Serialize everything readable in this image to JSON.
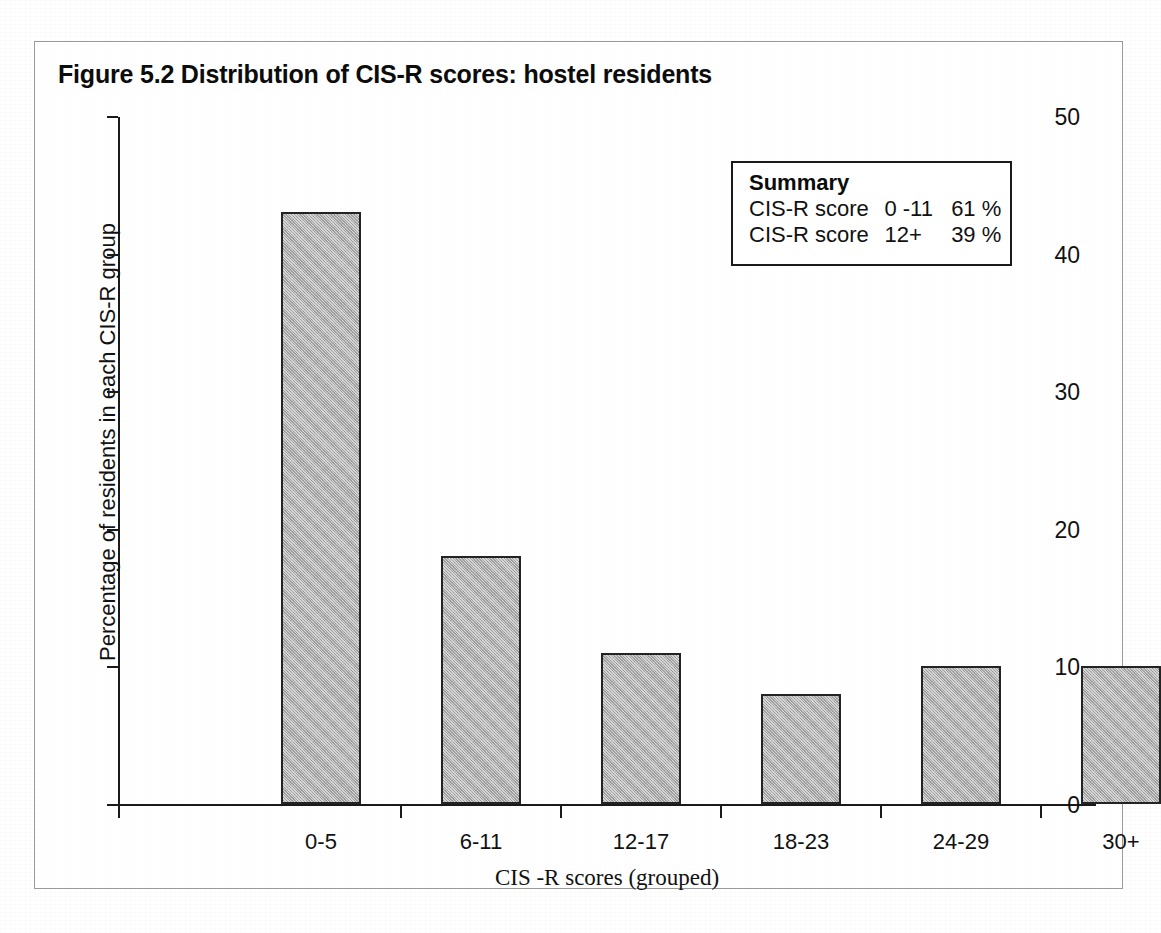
{
  "figure": {
    "title": "Figure 5.2  Distribution of CIS-R scores: hostel residents"
  },
  "summary": {
    "heading": "Summary",
    "rows": [
      {
        "label": "CIS-R score",
        "range": "0 -11",
        "value": "61 %"
      },
      {
        "label": "CIS-R score",
        "range": "12+",
        "value": "39 %"
      }
    ]
  },
  "chart_data": {
    "type": "bar",
    "title": "Figure 5.2  Distribution of CIS-R scores: hostel residents",
    "categories": [
      "0-5",
      "6-11",
      "12-17",
      "18-23",
      "24-29",
      "30+"
    ],
    "values": [
      43,
      18,
      11,
      8,
      10,
      10
    ],
    "xlabel": "CIS -R scores (grouped)",
    "ylabel": "Percentage of residents in each CIS-R group",
    "ylim": [
      0,
      50
    ],
    "yticks": [
      0,
      10,
      20,
      30,
      40,
      50
    ],
    "ytick_labels": [
      "0",
      "10",
      "20",
      "30",
      "40",
      "50"
    ],
    "grid": false,
    "legend": false,
    "bar_fill_color": "#a9a9a9",
    "bar_edge_color": "#232323",
    "axis_color": "#1a1a1a"
  }
}
